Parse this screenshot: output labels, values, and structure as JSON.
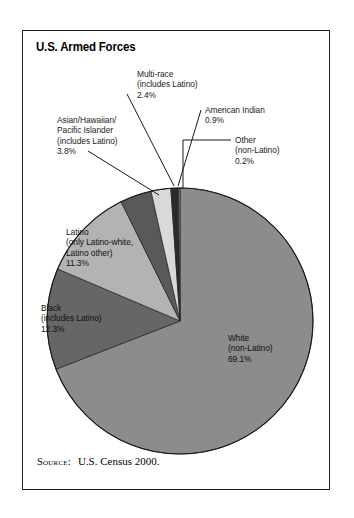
{
  "figure": {
    "title": "U.S. Armed Forces",
    "source_label": "Source:",
    "source_text": "U.S. Census 2000."
  },
  "labels": {
    "multirace": {
      "l1": "Multi-race",
      "l2": "(includes Latino)",
      "l3": "2.4%"
    },
    "amerindian": {
      "l1": "American Indian",
      "l2": "0.9%"
    },
    "other": {
      "l1": "Other",
      "l2": "(non-Latino)",
      "l3": "0.2%"
    },
    "asian": {
      "l1": "Asian/Hawaiian/",
      "l2": "Pacific Islander",
      "l3": "(includes Latino)",
      "l4": "3.8%"
    },
    "latino": {
      "l1": "Latino",
      "l2": "(only Latino-white,",
      "l3": "Latino other)",
      "l4": "11.3%"
    },
    "black": {
      "l1": "Black",
      "l2": "(includes Latino)",
      "l3": "12.3%"
    },
    "white": {
      "l1": "White",
      "l2": "(non-Latino)",
      "l3": "69.1%"
    }
  },
  "chart_data": {
    "type": "pie",
    "title": "U.S. Armed Forces",
    "subtitle": "",
    "source": "U.S. Census 2000.",
    "units": "percent",
    "total": 100.0,
    "start_angle_deg": 0,
    "direction": "clockwise",
    "legend_position": "none-labels-on-slices-and-callouts",
    "categories": [
      "White (non-Latino)",
      "Black (includes Latino)",
      "Latino (only Latino-white, Latino other)",
      "Asian/Hawaiian/Pacific Islander (includes Latino)",
      "Multi-race (includes Latino)",
      "American Indian",
      "Other (non-Latino)"
    ],
    "values": [
      69.1,
      12.3,
      11.3,
      3.8,
      2.4,
      0.9,
      0.2
    ],
    "slices": [
      {
        "name": "White (non-Latino)",
        "value": 69.1,
        "label": "69.1%",
        "color": "#8c8c8c",
        "label_placement": "inside"
      },
      {
        "name": "Black (includes Latino)",
        "value": 12.3,
        "label": "12.3%",
        "color": "#666666",
        "label_placement": "inside"
      },
      {
        "name": "Latino (only Latino-white, Latino other)",
        "value": 11.3,
        "label": "11.3%",
        "color": "#b3b3b3",
        "label_placement": "inside"
      },
      {
        "name": "Asian/Hawaiian/Pacific Islander (includes Latino)",
        "value": 3.8,
        "label": "3.8%",
        "color": "#595959",
        "label_placement": "callout"
      },
      {
        "name": "Multi-race (includes Latino)",
        "value": 2.4,
        "label": "2.4%",
        "color": "#d9d9d9",
        "label_placement": "callout"
      },
      {
        "name": "American Indian",
        "value": 0.9,
        "label": "0.9%",
        "color": "#2b2b2b",
        "label_placement": "callout"
      },
      {
        "name": "Other (non-Latino)",
        "value": 0.2,
        "label": "0.2%",
        "color": "#8c8c8c",
        "label_placement": "callout"
      }
    ]
  },
  "geometry": {
    "cx": 157,
    "cy": 290,
    "r": 133
  },
  "colors": {
    "frame": "#1a1a1a",
    "background": "#ffffff",
    "text": "#111111",
    "leader": "#1a1a1a"
  }
}
